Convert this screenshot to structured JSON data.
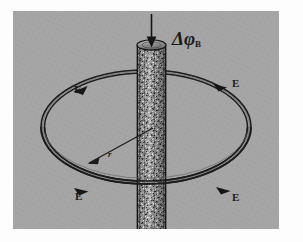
{
  "figure": {
    "background_color": "#a5a5a5",
    "ink_color": "#1b1b1b",
    "page_color": "#fdfdfd",
    "labels": {
      "flux_symbol": "Δφ",
      "flux_subscript": "B",
      "radius_symbol": "r",
      "field_top_left": "E",
      "field_top_right": "E",
      "field_bottom_left": "E",
      "field_bottom_right": "E"
    },
    "elements": {
      "rod_name": "magnetic-flux-rod",
      "ring_name": "field-line-ellipse",
      "flux_arrow_name": "flux-direction-arrow",
      "radius_arrow_name": "radius-arrow"
    },
    "geometry": {
      "ellipse_center_x": 146,
      "ellipse_center_y": 127,
      "ellipse_rx": 105,
      "ellipse_ry": 57,
      "rod_left": 137,
      "rod_right": 166,
      "rod_top": 42,
      "rod_bottom": 222
    }
  }
}
